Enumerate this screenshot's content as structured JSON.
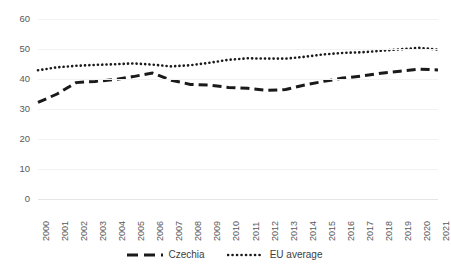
{
  "chart_data": {
    "type": "line",
    "title": "",
    "subtitle": "",
    "xlabel": "",
    "ylabel": "",
    "grid": true,
    "legend_position": "bottom",
    "ylim": [
      0,
      60
    ],
    "yticks": [
      0,
      10,
      20,
      30,
      40,
      50,
      60
    ],
    "ytick_labels": [
      "0",
      "10",
      "20",
      "30",
      "40",
      "50",
      "60"
    ],
    "categories": [
      "2000",
      "2001",
      "2002",
      "2003",
      "2004",
      "2005",
      "2006",
      "2007",
      "2008",
      "2009",
      "2010",
      "2011",
      "2012",
      "2013",
      "2014",
      "2015",
      "2016",
      "2017",
      "2018",
      "2019",
      "2020",
      "2021"
    ],
    "series": [
      {
        "name": "Czechia",
        "style": "dashed",
        "color": "#1a1a1a",
        "values": [
          32.2,
          35.0,
          38.8,
          39.2,
          39.8,
          40.8,
          42.0,
          39.6,
          38.2,
          38.0,
          37.2,
          36.9,
          36.2,
          36.5,
          38.0,
          39.2,
          40.3,
          41.0,
          41.9,
          42.6,
          43.3,
          43.0
        ]
      },
      {
        "name": "EU average",
        "style": "dotted",
        "color": "#1a1a1a",
        "values": [
          42.9,
          43.9,
          44.4,
          44.7,
          44.9,
          45.2,
          44.8,
          44.2,
          44.6,
          45.4,
          46.4,
          46.9,
          46.8,
          46.8,
          47.4,
          48.2,
          48.7,
          48.9,
          49.4,
          49.9,
          50.4,
          49.8
        ]
      }
    ],
    "legend": [
      {
        "label": "Czechia",
        "style": "dashed"
      },
      {
        "label": "EU average",
        "style": "dotted"
      }
    ]
  }
}
